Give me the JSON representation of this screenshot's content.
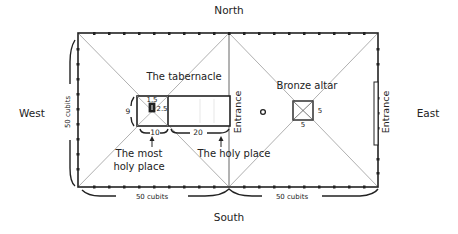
{
  "directions": {
    "north": "North",
    "south": "South",
    "west": "West",
    "east": "East"
  },
  "courtyard": {
    "width_label_left": "50 cubits",
    "width_label_right": "50 cubits",
    "height_label": "50 cubits"
  },
  "tabernacle": {
    "title": "The tabernacle",
    "height_dim": "9",
    "ark_top_dim": "1.5",
    "ark_side_dim": "2.5",
    "most_holy_length": "10",
    "holy_length": "20",
    "most_holy_label_line1": "The most",
    "most_holy_label_line2": "holy place",
    "holy_label": "The holy place"
  },
  "altar": {
    "title": "Bronze altar",
    "side_dim": "5",
    "bottom_dim": "5"
  },
  "entrances": {
    "middle": "Entrance",
    "east": "Entrance"
  },
  "colors": {
    "line": "#222222",
    "diagonal": "#9a9a9a",
    "text": "#222222"
  }
}
